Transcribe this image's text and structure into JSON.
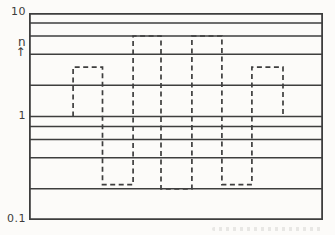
{
  "figure": {
    "background": "#fcfbf9",
    "line_color": "#3e3e3e",
    "frame_color": "#3a3a3a"
  },
  "axis": {
    "top_tick_label": "10",
    "ylabel": "n",
    "ylabel_arrow": "↑",
    "mid_tick_label": "1",
    "bottom_tick_label": "0.1"
  },
  "chart_data": {
    "type": "line",
    "subtype": "dashed-step-square-wave",
    "title": "",
    "xlabel": "",
    "ylabel": "n",
    "yscale": "log",
    "ylim": [
      0.1,
      10
    ],
    "y_tick_labels": [
      "10",
      "1",
      "0.1"
    ],
    "gridline_values": [
      10,
      8,
      6,
      4,
      2,
      1,
      0.8,
      0.6,
      0.4,
      0.2,
      0.1
    ],
    "grid": true,
    "legend": false,
    "x_range_normalized": [
      0,
      1
    ],
    "waveform": {
      "style": "dashed",
      "start_value": 1,
      "end_value": 1,
      "steps": [
        {
          "x_start": 0.15,
          "x_end": 0.25,
          "value": 3
        },
        {
          "x_start": 0.25,
          "x_end": 0.354,
          "value": 0.22
        },
        {
          "x_start": 0.354,
          "x_end": 0.449,
          "value": 6
        },
        {
          "x_start": 0.449,
          "x_end": 0.554,
          "value": 0.2
        },
        {
          "x_start": 0.554,
          "x_end": 0.656,
          "value": 6
        },
        {
          "x_start": 0.656,
          "x_end": 0.758,
          "value": 0.22
        },
        {
          "x_start": 0.758,
          "x_end": 0.864,
          "value": 3
        }
      ]
    }
  }
}
